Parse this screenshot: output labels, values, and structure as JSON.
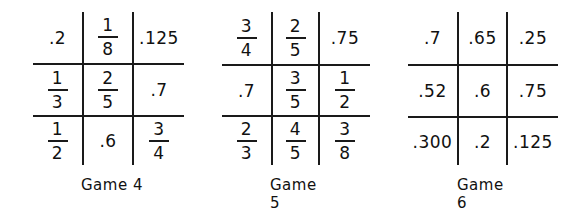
{
  "games": [
    {
      "title": "Game 4",
      "cells": [
        [
          {
            "type": "dec",
            "text": ".2"
          },
          {
            "type": "frac",
            "num": "1",
            "den": "8"
          },
          {
            "type": "dec",
            "text": ".125"
          }
        ],
        [
          {
            "type": "frac",
            "num": "1",
            "den": "3"
          },
          {
            "type": "frac",
            "num": "2",
            "den": "5"
          },
          {
            "type": "dec",
            "text": ".7"
          }
        ],
        [
          {
            "type": "frac",
            "num": "1",
            "den": "2"
          },
          {
            "type": "dec",
            "text": ".6"
          },
          {
            "type": "frac",
            "num": "3",
            "den": "4"
          }
        ]
      ]
    },
    {
      "title": "Game 5",
      "cells": [
        [
          {
            "type": "frac",
            "num": "3",
            "den": "4"
          },
          {
            "type": "frac",
            "num": "2",
            "den": "5"
          },
          {
            "type": "dec",
            "text": ".75"
          }
        ],
        [
          {
            "type": "dec",
            "text": ".7"
          },
          {
            "type": "frac",
            "num": "3",
            "den": "5"
          },
          {
            "type": "frac",
            "num": "1",
            "den": "2"
          }
        ],
        [
          {
            "type": "frac",
            "num": "2",
            "den": "3"
          },
          {
            "type": "frac",
            "num": "4",
            "den": "5"
          },
          {
            "type": "frac",
            "num": "3",
            "den": "8"
          }
        ]
      ]
    },
    {
      "title": "Game 6",
      "cells": [
        [
          {
            "type": "dec",
            "text": ".7"
          },
          {
            "type": "dec",
            "text": ".65"
          },
          {
            "type": "dec",
            "text": ".25"
          }
        ],
        [
          {
            "type": "dec",
            "text": ".52"
          },
          {
            "type": "dec",
            "text": ".6"
          },
          {
            "type": "dec",
            "text": ".75"
          }
        ],
        [
          {
            "type": "dec",
            "text": ".300"
          },
          {
            "type": "dec",
            "text": ".2"
          },
          {
            "type": "dec",
            "text": ".125"
          }
        ]
      ]
    }
  ]
}
